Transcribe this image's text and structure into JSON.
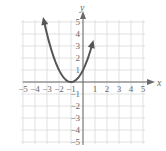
{
  "chart_data": {
    "type": "line",
    "title": "",
    "xlabel": "x",
    "ylabel": "y",
    "xlim": [
      -5,
      5
    ],
    "ylim": [
      -5,
      5
    ],
    "grid": true,
    "x_ticks": [
      "-5",
      "-4",
      "-3",
      "-2",
      "-1",
      "1",
      "2",
      "3",
      "4",
      "5"
    ],
    "y_ticks": [
      "5",
      "4",
      "3",
      "2",
      "1",
      "-1",
      "-2",
      "-3",
      "-4",
      "-5"
    ],
    "series": [
      {
        "name": "y = (x + 1)^2",
        "x": [
          -3.24,
          -3,
          -2.5,
          -2,
          -1.5,
          -1,
          -0.5,
          0,
          0.5,
          0.76
        ],
        "y": [
          5,
          4,
          2.25,
          1,
          0.25,
          0,
          0.25,
          1,
          2.25,
          3.1
        ],
        "vertex": [
          -1,
          0
        ],
        "arrows_at_ends": true
      }
    ]
  }
}
